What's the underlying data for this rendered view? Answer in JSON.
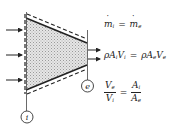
{
  "diagram": {
    "inlet_label": "i",
    "exit_label": "e",
    "inlet_arrow_count": 3,
    "exit_arrow_count": 2,
    "fill_color": "#d8d8d8",
    "line_color": "#222222"
  },
  "equations": {
    "mass_balance": {
      "lhs": "m",
      "lhs_sub": "i",
      "op": "=",
      "rhs": "m",
      "rhs_sub": "e"
    },
    "continuity": {
      "lhs_rho": "ρ",
      "lhs_A": "A",
      "lhs_A_sub": "i",
      "lhs_V": "V",
      "lhs_V_sub": "i",
      "op": "=",
      "rhs_rho": "ρ",
      "rhs_A": "A",
      "rhs_A_sub": "e",
      "rhs_V": "V",
      "rhs_V_sub": "e"
    },
    "velocity_ratio": {
      "left_num": "V",
      "left_num_sub": "e",
      "left_den": "V",
      "left_den_sub": "i",
      "op": "=",
      "right_num": "A",
      "right_num_sub": "i",
      "right_den": "A",
      "right_den_sub": "e"
    }
  }
}
